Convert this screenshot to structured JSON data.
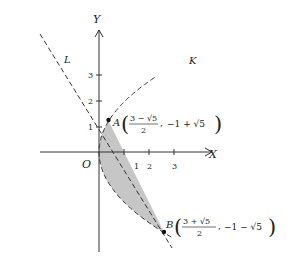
{
  "diagram": {
    "axes": {
      "x_label": "X",
      "y_label": "Y",
      "origin_label": "O",
      "x_ticks": [
        "1",
        "2",
        "3"
      ],
      "y_ticks": [
        "1",
        "2",
        "3"
      ]
    },
    "curves": [
      {
        "name": "K",
        "type": "parabola",
        "equation": "y^2 = 4x",
        "style": "dashed"
      },
      {
        "name": "L",
        "type": "line",
        "equation": "y = 2 - 2x",
        "style": "dashed"
      }
    ],
    "points": [
      {
        "name": "A",
        "coords": "((3 − √5)/2, −1 + √5)",
        "num_top": "3 − √5",
        "den": "2",
        "second": "−1 + √5"
      },
      {
        "name": "B",
        "coords": "((3 + √5)/2, −1 − √5)",
        "num_top": "3 + √5",
        "den": "2",
        "second": "−1 − √5"
      }
    ],
    "shaded_region": {
      "fill": "#c8c8c8",
      "bounded_by": [
        "K",
        "L"
      ]
    }
  }
}
